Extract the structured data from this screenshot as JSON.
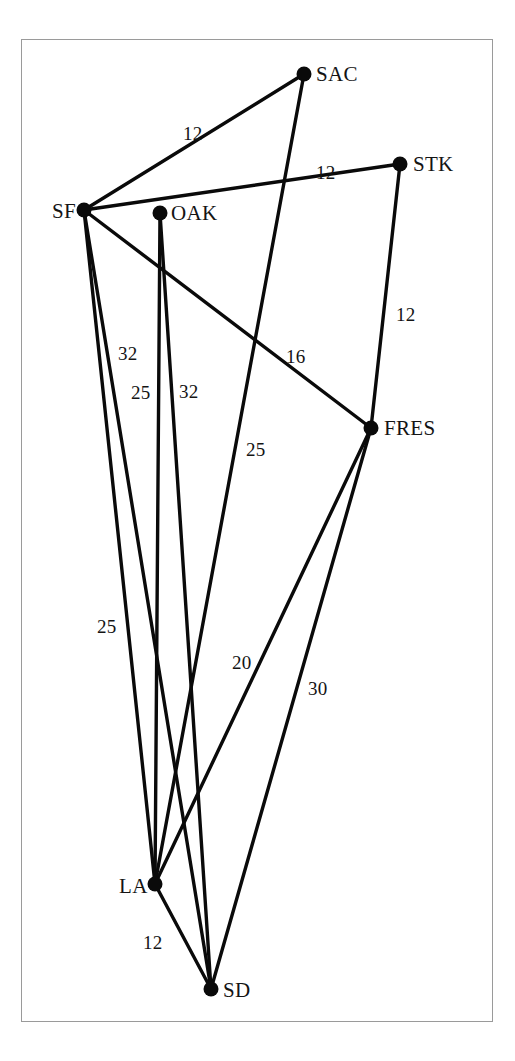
{
  "figure": {
    "frame_color": "#9a9a9a",
    "background_color": "#ffffff",
    "ink_color": "#0a0a0a"
  },
  "chart_data": {
    "type": "diagram",
    "subtype": "weighted-undirected-graph",
    "title": "",
    "xlabel": "",
    "ylabel": "",
    "grid": false,
    "legend": null,
    "node_label_key": "city abbreviations",
    "edge_label_meaning": "edge weight",
    "nodes": [
      {
        "id": "SF",
        "label": "SF",
        "x": 84,
        "y": 210,
        "label_dx": -32,
        "label_dy": -9
      },
      {
        "id": "OAK",
        "label": "OAK",
        "x": 160,
        "y": 213,
        "label_dx": 11,
        "label_dy": -10
      },
      {
        "id": "SAC",
        "label": "SAC",
        "x": 304,
        "y": 74,
        "label_dx": 12,
        "label_dy": -10
      },
      {
        "id": "STK",
        "label": "STK",
        "x": 400,
        "y": 164,
        "label_dx": 13,
        "label_dy": -10
      },
      {
        "id": "FRES",
        "label": "FRES",
        "x": 371,
        "y": 428,
        "label_dx": 13,
        "label_dy": -10
      },
      {
        "id": "LA",
        "label": "LA",
        "x": 155,
        "y": 884,
        "label_dx": -36,
        "label_dy": -8
      },
      {
        "id": "SD",
        "label": "SD",
        "x": 211,
        "y": 989,
        "label_dx": 12,
        "label_dy": -9
      }
    ],
    "edges": [
      {
        "source": "SF",
        "target": "SAC",
        "weight": 12,
        "label": "12",
        "label_x": 183,
        "label_y": 124
      },
      {
        "source": "SF",
        "target": "STK",
        "weight": 12,
        "label": "12",
        "label_x": 316,
        "label_y": 163
      },
      {
        "source": "SF",
        "target": "FRES",
        "weight": 16,
        "label": "16",
        "label_x": 286,
        "label_y": 347
      },
      {
        "source": "SF",
        "target": "LA",
        "weight": 32,
        "label": "32",
        "label_x": 118,
        "label_y": 344
      },
      {
        "source": "SF",
        "target": "SD",
        "weight": 25,
        "label": "25",
        "label_x": 131,
        "label_y": 383
      },
      {
        "source": "OAK",
        "target": "LA",
        "weight": 32,
        "label": "32",
        "label_x": 179,
        "label_y": 382
      },
      {
        "source": "OAK",
        "target": "SD",
        "weight": 25,
        "label": "25",
        "label_x": 97,
        "label_y": 617
      },
      {
        "source": "SAC",
        "target": "LA",
        "weight": 25,
        "label": "25",
        "label_x": 246,
        "label_y": 440
      },
      {
        "source": "STK",
        "target": "FRES",
        "weight": 12,
        "label": "12",
        "label_x": 396,
        "label_y": 305
      },
      {
        "source": "FRES",
        "target": "LA",
        "weight": 20,
        "label": "20",
        "label_x": 232,
        "label_y": 653
      },
      {
        "source": "FRES",
        "target": "SD",
        "weight": 30,
        "label": "30",
        "label_x": 308,
        "label_y": 679
      },
      {
        "source": "LA",
        "target": "SD",
        "weight": 12,
        "label": "12",
        "label_x": 143,
        "label_y": 933
      }
    ],
    "node_radius": 7.5,
    "edge_stroke_width": 3.4,
    "xlim": [
      21,
      493
    ],
    "ylim": [
      39,
      1022
    ]
  }
}
